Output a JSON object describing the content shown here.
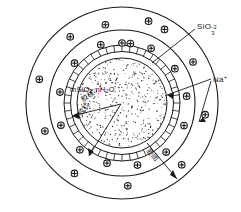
{
  "figure": {
    "background": "#ffffff",
    "stroke": "#1a1a1a",
    "center_formula": "mSiO",
    "center_formula_sub1": "2",
    "center_formula_mid": "·nH",
    "center_formula_sub2": "2",
    "center_formula_end": "O",
    "labels": {
      "silicate_base": "SiO",
      "silicate_sub": "3",
      "silicate_sup": "-2",
      "sodium_base": "Na",
      "sodium_sup": "+",
      "nucleus": "胶核",
      "particle": "胶粒",
      "micelle": "胶团"
    },
    "geometry": {
      "center_x": 122,
      "center_y": 103,
      "outer_radius": 96,
      "middle_radius": 73,
      "ring_outer_radius": 58,
      "ring_inner_radius": 51,
      "core_radius": 45,
      "tick_count": 44
    },
    "ion_symbol": "plus-in-circle",
    "ion_count_outer_band": 11,
    "ion_count_middle_band": 13
  }
}
